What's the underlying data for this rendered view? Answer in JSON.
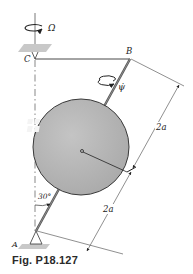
{
  "figure": {
    "caption": "Fig. P18.127",
    "labels": {
      "omega": "Ω",
      "point_c": "C",
      "point_b": "B",
      "point_a": "A",
      "psi_dot": "ψ̇",
      "angle": "30°",
      "dim_upper": "2a",
      "dim_lower": "2a"
    },
    "colors": {
      "sphere_fill": "#b9b9b9",
      "sphere_stroke": "#3a3a3a",
      "line": "#333333",
      "support_hatch": "#c8c8c8"
    }
  }
}
